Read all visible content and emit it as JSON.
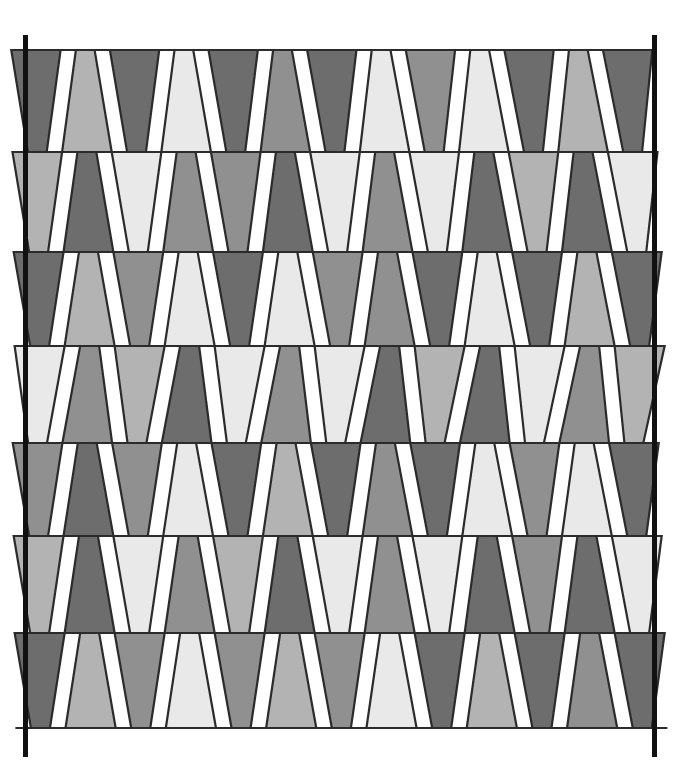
{
  "figure": {
    "canvas": {
      "width": 684,
      "height": 767,
      "background": "#ffffff"
    }
  },
  "palette": {
    "light": "#e9e9e9",
    "mid_light": "#b3b3b3",
    "mid": "#909090",
    "dark": "#6d6d6d",
    "outline": "#2b2b2b",
    "bar": "#111111",
    "background": "#ffffff"
  },
  "vertical_bars": [
    {
      "name": "left-bar",
      "x": 25.5,
      "y_top": 35,
      "y_bottom": 757,
      "width": 5
    },
    {
      "name": "right-bar",
      "x": 654.5,
      "y_top": 35,
      "y_bottom": 757,
      "width": 5
    }
  ],
  "grid": {
    "rows": 7,
    "columns": 13,
    "x_left": 18,
    "x_right": 663,
    "row_boundaries": [
      50,
      152,
      252,
      346,
      443,
      536,
      633,
      728
    ],
    "row_left_offsets": [
      56,
      46,
      36,
      28,
      44,
      36,
      28,
      22
    ],
    "row_right_offsets": [
      -8,
      0,
      6,
      10,
      2,
      6,
      10,
      14
    ],
    "tile_outline_width": 2.2,
    "waist_ratio": 0.38
  },
  "chart_data": {
    "type": "heatmap",
    "xlabel": "",
    "ylabel": "",
    "grid": true,
    "legend": "none",
    "categories": [
      "c1",
      "c2",
      "c3",
      "c4",
      "c5",
      "c6",
      "c7",
      "c8",
      "c9",
      "c10",
      "c11",
      "c12",
      "c13"
    ],
    "row_labels": [
      "r1",
      "r2",
      "r3",
      "r4",
      "r5",
      "r6",
      "r7"
    ],
    "value_legend": {
      "0": "light",
      "1": "mid_light",
      "2": "mid",
      "3": "dark"
    },
    "shade_rows": [
      [
        3,
        1,
        3,
        0,
        3,
        2,
        3,
        0,
        2,
        0,
        3,
        1,
        3
      ],
      [
        1,
        3,
        0,
        2,
        2,
        3,
        0,
        2,
        0,
        3,
        1,
        3,
        0
      ],
      [
        3,
        1,
        2,
        0,
        3,
        0,
        2,
        2,
        3,
        0,
        3,
        1,
        3
      ],
      [
        0,
        2,
        1,
        3,
        0,
        2,
        0,
        3,
        1,
        3,
        0,
        2,
        1
      ],
      [
        2,
        3,
        2,
        0,
        3,
        1,
        3,
        2,
        3,
        0,
        2,
        0,
        3
      ],
      [
        1,
        3,
        0,
        2,
        1,
        3,
        0,
        2,
        0,
        3,
        2,
        3,
        0
      ],
      [
        3,
        1,
        2,
        0,
        2,
        1,
        2,
        0,
        3,
        1,
        3,
        2,
        3
      ]
    ],
    "orientation_note": "Within every row tiles alternate: even index = narrow-bottom trapezoid (wide top), odd index = wide-bottom trapezoid (narrow top)."
  }
}
